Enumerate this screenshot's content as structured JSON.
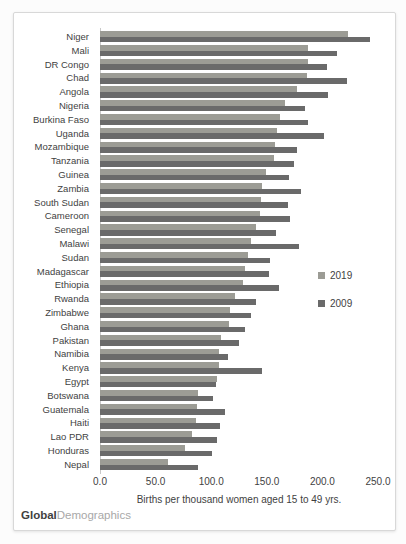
{
  "chart_data": {
    "type": "bar",
    "orientation": "horizontal",
    "grouped": true,
    "title": "",
    "xlabel": "Births per thousand women aged 15 to 49 yrs.",
    "ylabel": "",
    "xlim": [
      0,
      250
    ],
    "x_ticks": [
      "0.0",
      "50.0",
      "100.0",
      "150.0",
      "200.0",
      "250.0"
    ],
    "grid": false,
    "legend_position": "right-middle",
    "legend": [
      {
        "label": "2019",
        "color": "#9c9c95"
      },
      {
        "label": "2009",
        "color": "#6a6a6a"
      }
    ],
    "categories": [
      "Niger",
      "Mali",
      "DR Congo",
      "Chad",
      "Angola",
      "Nigeria",
      "Burkina Faso",
      "Uganda",
      "Mozambique",
      "Tanzania",
      "Guinea",
      "Zambia",
      "South Sudan",
      "Cameroon",
      "Senegal",
      "Malawi",
      "Sudan",
      "Madagascar",
      "Ethiopia",
      "Rwanda",
      "Zimbabwe",
      "Ghana",
      "Pakistan",
      "Namibia",
      "Kenya",
      "Egypt",
      "Botswana",
      "Guatemala",
      "Haiti",
      "Lao PDR",
      "Honduras",
      "Nepal"
    ],
    "series": [
      {
        "name": "2019",
        "color": "#9c9c95",
        "values": [
          223,
          187,
          187,
          186,
          177,
          166,
          162,
          159,
          157,
          156,
          149,
          146,
          145,
          144,
          140,
          136,
          133,
          130,
          129,
          121,
          117,
          116,
          109,
          107,
          107,
          105,
          88,
          87,
          86,
          83,
          76,
          61
        ]
      },
      {
        "name": "2009",
        "color": "#6a6a6a",
        "values": [
          243,
          213,
          204,
          222,
          205,
          184,
          187,
          201,
          177,
          174,
          170,
          181,
          169,
          171,
          158,
          179,
          153,
          152,
          161,
          140,
          136,
          130,
          125,
          115,
          146,
          104,
          102,
          112,
          108,
          105,
          101,
          88
        ]
      }
    ]
  },
  "footer": {
    "brand_bold": "Global",
    "brand_light": "Demographics"
  },
  "colors": {
    "series_2019": "#9c9c95",
    "series_2009": "#6a6a6a",
    "text": "#3f3f3f",
    "border": "#d8d8d8",
    "axis_line": "#c9c9c9",
    "background": "#ffffff"
  }
}
